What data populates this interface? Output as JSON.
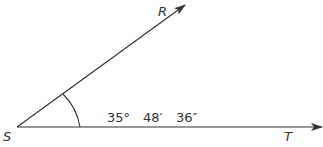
{
  "diagram": {
    "type": "angle",
    "vertex": {
      "label": "S",
      "x": 17,
      "y": 127
    },
    "rays": [
      {
        "label": "R",
        "end": {
          "x": 185,
          "y": 5
        }
      },
      {
        "label": "T",
        "end": {
          "x": 322,
          "y": 127
        }
      }
    ],
    "angle_measure": {
      "degrees": "35°",
      "minutes": "48′",
      "seconds": "36″"
    },
    "colors": {
      "stroke": "#333333",
      "background": "#ffffff"
    }
  }
}
